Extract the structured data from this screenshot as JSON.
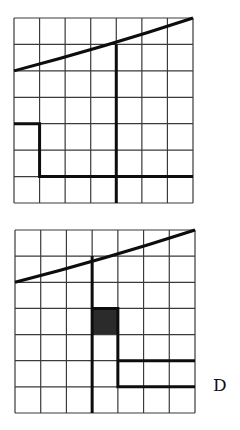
{
  "figures": [
    {
      "id": "top-grid",
      "x": 14,
      "y": 18,
      "width": 179,
      "height": 185,
      "cols": 7,
      "rows": 7,
      "thin_color": "#3a3a3a",
      "bold_color": "#0d0d0d",
      "shaded_cells": [],
      "bold_paths": [
        [
          [
            0,
            2
          ],
          [
            7,
            0
          ]
        ],
        [
          [
            4,
            1
          ],
          [
            4,
            7
          ]
        ],
        [
          [
            0,
            4
          ],
          [
            1,
            4
          ],
          [
            1,
            6
          ],
          [
            7,
            6
          ]
        ]
      ],
      "diagonal_curve": true
    },
    {
      "id": "bottom-grid",
      "x": 15,
      "y": 230,
      "width": 180,
      "height": 183,
      "cols": 7,
      "rows": 7,
      "thin_color": "#3a3a3a",
      "bold_color": "#0d0d0d",
      "shaded_cells": [
        [
          3,
          3
        ]
      ],
      "shade_color": "#2b2b2b",
      "bold_paths": [
        [
          [
            0,
            2
          ],
          [
            7,
            0
          ]
        ],
        [
          [
            3,
            1
          ],
          [
            3,
            7
          ]
        ],
        [
          [
            3,
            3
          ],
          [
            4,
            3
          ],
          [
            4,
            4
          ]
        ],
        [
          [
            4,
            4
          ],
          [
            4,
            6
          ],
          [
            7,
            6
          ]
        ],
        [
          [
            4,
            5
          ],
          [
            7,
            5
          ]
        ]
      ],
      "label": "D"
    }
  ]
}
